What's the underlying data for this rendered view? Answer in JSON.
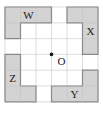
{
  "diagram": {
    "grid": {
      "cols": 6,
      "rows": 6,
      "origin_x": 5,
      "origin_y": 7,
      "cell_w": 15.5,
      "cell_h": 15.8,
      "line_color": "#d4d4d4",
      "border_color": "#cfcfcf"
    },
    "shape_fill": "#d3d3d3",
    "shape_stroke": "#8a8a8a",
    "shapes": [
      {
        "label": "W",
        "cells": [
          [
            0,
            0
          ],
          [
            1,
            0
          ],
          [
            2,
            0
          ],
          [
            0,
            1
          ]
        ]
      },
      {
        "label": "X",
        "cells": [
          [
            4,
            0
          ],
          [
            5,
            0
          ],
          [
            5,
            1
          ],
          [
            5,
            2
          ]
        ]
      },
      {
        "label": "Y",
        "cells": [
          [
            5,
            4
          ],
          [
            3,
            5
          ],
          [
            4,
            5
          ],
          [
            5,
            5
          ]
        ]
      },
      {
        "label": "Z",
        "cells": [
          [
            0,
            3
          ],
          [
            0,
            4
          ],
          [
            0,
            5
          ],
          [
            1,
            5
          ]
        ]
      }
    ],
    "center_point": {
      "label": "O",
      "grid_x": 3,
      "grid_y": 3
    }
  }
}
